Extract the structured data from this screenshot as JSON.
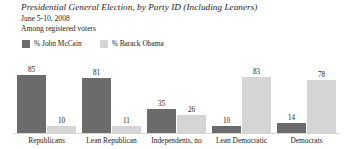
{
  "header": {
    "title": "Presidential General Election, by Party ID (Including Leaners)",
    "subtitle": "June 5-10, 2008",
    "subtitle2": "Among registered voters"
  },
  "legend": {
    "position": "top-left",
    "items": [
      {
        "label": "% John McCain",
        "color": "#6b6b6b",
        "swatch_name": "legend-swatch-mccain"
      },
      {
        "label": "% Barack Obama",
        "color": "#d5d5d5",
        "swatch_name": "legend-swatch-obama"
      }
    ]
  },
  "colors": {
    "mccain": "#6b6b6b",
    "obama": "#d5d5d5",
    "baseline": "#d8d5cf",
    "text": "#1c1c1c",
    "background": "#ffffff"
  },
  "chart_data": {
    "type": "bar",
    "title": "Presidential General Election, by Party ID (Including Leaners)",
    "subtitle": "June 5-10, 2008",
    "note": "Among registered voters",
    "xlabel": "",
    "ylabel": "",
    "ylim": [
      0,
      100
    ],
    "grid": false,
    "legend_position": "top-left",
    "categories": [
      "Republicans",
      "Lean Republican",
      "Independents, no",
      "Lean Democratic",
      "Democrats"
    ],
    "series": [
      {
        "name": "% John McCain",
        "color": "#6b6b6b",
        "values": [
          85,
          81,
          35,
          10,
          14
        ]
      },
      {
        "name": "% Barack Obama",
        "color": "#d5d5d5",
        "values": [
          10,
          11,
          26,
          83,
          78
        ]
      }
    ]
  }
}
